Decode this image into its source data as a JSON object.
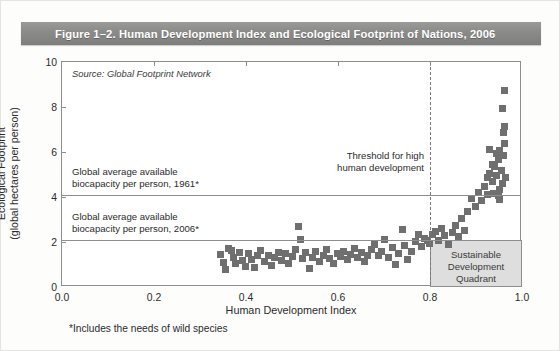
{
  "title": "Figure 1–2. Human Development Index and Ecological Footprint of Nations, 2006",
  "footnote": "*Includes the needs of wild species",
  "colors": {
    "banner": "#8a8a88",
    "marker": "#6f6f6f",
    "quadrant_fill": "#dedede",
    "axis": "#8e8e8e"
  },
  "annotations": {
    "source": "Source: Global Footprint Network",
    "threshold_line1": "Threshold for high",
    "threshold_line2": "human development",
    "biocapacity_1961_line1": "Global average available",
    "biocapacity_1961_line2": "biocapacity per person, 1961*",
    "biocapacity_2006_line1": "Global average available",
    "biocapacity_2006_line2": "biocapacity per person, 2006*",
    "quadrant_line1": "Sustainable",
    "quadrant_line2": "Development",
    "quadrant_line3": "Quadrant"
  },
  "chart_data": {
    "type": "scatter",
    "title": "Figure 1–2. Human Development Index and Ecological Footprint of Nations, 2006",
    "xlabel": "Human Development Index",
    "ylabel": "Ecological Footprint (global hectares per person)",
    "xlim": [
      0.0,
      1.0
    ],
    "ylim": [
      0,
      10
    ],
    "xticks": [
      "0.0",
      "0.2",
      "0.4",
      "0.6",
      "0.8",
      "1.0"
    ],
    "xtick_values": [
      0.0,
      0.2,
      0.4,
      0.6,
      0.8,
      1.0
    ],
    "yticks": [
      "0",
      "2",
      "4",
      "6",
      "8",
      "10"
    ],
    "ytick_values": [
      0,
      2,
      4,
      6,
      8,
      10
    ],
    "grid": false,
    "legend": "none",
    "marker": "square",
    "marker_color": "#6f6f6f",
    "reference_lines": [
      {
        "name": "biocapacity-1961",
        "orientation": "horizontal",
        "value": 4.1,
        "style": "solid",
        "label": "Global average available biocapacity per person, 1961*"
      },
      {
        "name": "biocapacity-2006",
        "orientation": "horizontal",
        "value": 2.1,
        "style": "solid",
        "label": "Global average available biocapacity per person, 2006*"
      },
      {
        "name": "hdi-threshold",
        "orientation": "vertical",
        "value": 0.8,
        "style": "dashed",
        "label": "Threshold for high human development"
      }
    ],
    "shaded_regions": [
      {
        "name": "sustainable-development-quadrant",
        "x_range": [
          0.8,
          1.0
        ],
        "y_range": [
          0.0,
          2.1
        ],
        "fill": "#dedede",
        "label": "Sustainable Development Quadrant"
      }
    ],
    "series": [
      {
        "name": "Nations",
        "points": [
          [
            0.345,
            1.45
          ],
          [
            0.355,
            0.8
          ],
          [
            0.368,
            1.62
          ],
          [
            0.372,
            1.3
          ],
          [
            0.378,
            1.05
          ],
          [
            0.385,
            1.55
          ],
          [
            0.392,
            1.18
          ],
          [
            0.398,
            0.92
          ],
          [
            0.352,
            1.08
          ],
          [
            0.362,
            1.72
          ],
          [
            0.405,
            1.5
          ],
          [
            0.412,
            1.22
          ],
          [
            0.418,
            0.88
          ],
          [
            0.425,
            1.38
          ],
          [
            0.432,
            1.62
          ],
          [
            0.44,
            1.12
          ],
          [
            0.448,
            1.42
          ],
          [
            0.455,
            0.95
          ],
          [
            0.462,
            1.3
          ],
          [
            0.47,
            1.55
          ],
          [
            0.478,
            1.18
          ],
          [
            0.485,
            1.48
          ],
          [
            0.492,
            1.05
          ],
          [
            0.5,
            1.35
          ],
          [
            0.508,
            1.68
          ],
          [
            0.515,
            2.7
          ],
          [
            0.518,
            2.1
          ],
          [
            0.522,
            1.25
          ],
          [
            0.53,
            1.52
          ],
          [
            0.538,
            0.82
          ],
          [
            0.545,
            1.3
          ],
          [
            0.552,
            1.58
          ],
          [
            0.56,
            1.15
          ],
          [
            0.568,
            1.42
          ],
          [
            0.575,
            1.68
          ],
          [
            0.582,
            1.28
          ],
          [
            0.59,
            1.05
          ],
          [
            0.598,
            1.48
          ],
          [
            0.605,
            1.35
          ],
          [
            0.612,
            1.6
          ],
          [
            0.62,
            1.22
          ],
          [
            0.628,
            1.45
          ],
          [
            0.635,
            1.7
          ],
          [
            0.642,
            1.32
          ],
          [
            0.65,
            1.55
          ],
          [
            0.658,
            1.12
          ],
          [
            0.665,
            1.42
          ],
          [
            0.672,
            1.65
          ],
          [
            0.68,
            1.9
          ],
          [
            0.688,
            1.38
          ],
          [
            0.695,
            1.58
          ],
          [
            0.702,
            2.12
          ],
          [
            0.71,
            1.3
          ],
          [
            0.718,
            1.75
          ],
          [
            0.725,
            1.02
          ],
          [
            0.732,
            1.48
          ],
          [
            0.74,
            2.55
          ],
          [
            0.745,
            1.85
          ],
          [
            0.752,
            1.22
          ],
          [
            0.76,
            1.6
          ],
          [
            0.768,
            2.02
          ],
          [
            0.775,
            2.35
          ],
          [
            0.782,
            1.78
          ],
          [
            0.788,
            2.15
          ],
          [
            0.795,
            2.05
          ],
          [
            0.798,
            1.95
          ],
          [
            0.805,
            2.35
          ],
          [
            0.812,
            2.45
          ],
          [
            0.818,
            2.08
          ],
          [
            0.825,
            2.6
          ],
          [
            0.832,
            2.28
          ],
          [
            0.84,
            1.9
          ],
          [
            0.848,
            2.42
          ],
          [
            0.855,
            2.72
          ],
          [
            0.862,
            2.25
          ],
          [
            0.868,
            3.05
          ],
          [
            0.875,
            2.5
          ],
          [
            0.882,
            3.35
          ],
          [
            0.89,
            3.95
          ],
          [
            0.898,
            3.6
          ],
          [
            0.905,
            4.2
          ],
          [
            0.912,
            3.85
          ],
          [
            0.918,
            4.45
          ],
          [
            0.925,
            4.1
          ],
          [
            0.93,
            5.05
          ],
          [
            0.935,
            4.7
          ],
          [
            0.94,
            5.35
          ],
          [
            0.944,
            4.95
          ],
          [
            0.948,
            5.65
          ],
          [
            0.95,
            4.32
          ],
          [
            0.952,
            6.05
          ],
          [
            0.955,
            5.2
          ],
          [
            0.958,
            4.58
          ],
          [
            0.96,
            5.85
          ],
          [
            0.962,
            6.4
          ],
          [
            0.964,
            4.88
          ],
          [
            0.948,
            4.05
          ],
          [
            0.952,
            3.9
          ],
          [
            0.938,
            4.15
          ],
          [
            0.958,
            4.62
          ],
          [
            0.96,
            6.85
          ],
          [
            0.962,
            7.15
          ],
          [
            0.958,
            7.95
          ],
          [
            0.962,
            8.75
          ],
          [
            0.93,
            6.1
          ],
          [
            0.944,
            5.95
          ],
          [
            0.936,
            5.45
          ],
          [
            0.926,
            4.85
          ]
        ]
      }
    ]
  }
}
